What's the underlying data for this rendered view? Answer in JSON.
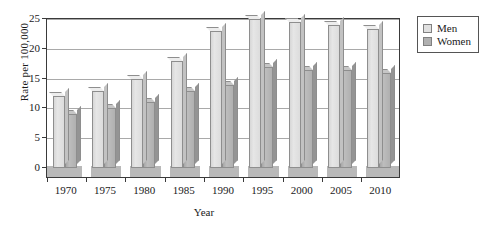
{
  "chart_data": {
    "type": "bar",
    "title": "",
    "xlabel": "Year",
    "ylabel": "Rate per 100,000",
    "categories": [
      "1970",
      "1975",
      "1980",
      "1985",
      "1990",
      "1995",
      "2000",
      "2005",
      "2010"
    ],
    "series": [
      {
        "name": "Men",
        "color": "#e0e0e0",
        "values": [
          12,
          13,
          15,
          18,
          23,
          25,
          24.5,
          24,
          23.3
        ]
      },
      {
        "name": "Women",
        "color": "#b0b0b0",
        "values": [
          9,
          10,
          11,
          13,
          14,
          17,
          16.5,
          16.5,
          16
        ]
      }
    ],
    "ylim": [
      0,
      25
    ],
    "yticks": [
      0,
      5,
      10,
      15,
      20,
      25
    ],
    "ytick_labels": [
      "0",
      "5",
      "10",
      "15",
      "20",
      "25"
    ],
    "grid": true,
    "legend_position": "right-top"
  },
  "legend": {
    "items": [
      {
        "label": "Men",
        "swatch": "legend-swatch-men"
      },
      {
        "label": "Women",
        "swatch": "legend-swatch-women"
      }
    ]
  },
  "axes": {
    "y_title": "Rate per 100,000",
    "x_title": "Year"
  }
}
